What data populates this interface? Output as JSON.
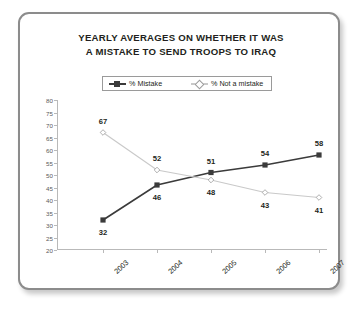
{
  "card": {
    "border_color": "#8c8c8c",
    "background": "#ffffff"
  },
  "title": {
    "line1": "YEARLY AVERAGES ON WHETHER IT WAS",
    "line2": "A MISTAKE TO SEND TROOPS TO IRAQ"
  },
  "legend": {
    "items": [
      {
        "label": "% Mistake",
        "color": "#3b3b3b",
        "marker": "filled-square"
      },
      {
        "label": "% Not a mistake",
        "color": "#c9c9c9",
        "marker": "open-diamond"
      }
    ]
  },
  "chart_data": {
    "type": "line",
    "title": "YEARLY AVERAGES ON WHETHER IT WAS A MISTAKE TO SEND TROOPS TO IRAQ",
    "xlabel": "",
    "ylabel": "",
    "categories": [
      "2003",
      "2004",
      "2005",
      "2006",
      "2007"
    ],
    "ylim": [
      20,
      80
    ],
    "yticks": [
      20,
      25,
      30,
      35,
      40,
      45,
      50,
      55,
      60,
      65,
      70,
      75,
      80
    ],
    "ytick_labels": [
      "20",
      "25",
      "30",
      "35",
      "40",
      "45",
      "50",
      "55",
      "60",
      "65",
      "70",
      "75",
      "80"
    ],
    "grid": false,
    "legend_position": "top-center",
    "series": [
      {
        "name": "% Mistake",
        "color": "#3b3b3b",
        "marker": "filled-square",
        "values": [
          32,
          46,
          51,
          54,
          58
        ],
        "labels": [
          "32",
          "46",
          "51",
          "54",
          "58"
        ],
        "label_side": [
          "below",
          "below",
          "above",
          "above",
          "above"
        ]
      },
      {
        "name": "% Not a mistake",
        "color": "#c9c9c9",
        "marker": "open-diamond",
        "values": [
          67,
          52,
          48,
          43,
          41
        ],
        "labels": [
          "67",
          "52",
          "48",
          "43",
          "41"
        ],
        "label_side": [
          "above",
          "above",
          "below",
          "below",
          "below"
        ]
      }
    ]
  }
}
